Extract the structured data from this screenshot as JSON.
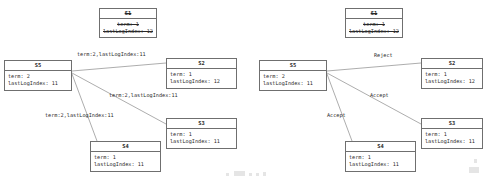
{
  "diagrams": [
    {
      "id": "left-diagram",
      "nodes": [
        {
          "id": "s1",
          "title": "S1",
          "stale": true,
          "lines": [
            "term: 1",
            "lastLogIndex: 12"
          ],
          "x": 99,
          "y": 8,
          "w": 58,
          "h": 30
        },
        {
          "id": "s5",
          "title": "S5",
          "stale": false,
          "lines": [
            "term: 2",
            "lastLogIndex: 11"
          ],
          "x": 4,
          "y": 60,
          "w": 68,
          "h": 31
        },
        {
          "id": "s2",
          "title": "S2",
          "stale": false,
          "lines": [
            "term: 1",
            "lastLogIndex: 12"
          ],
          "x": 166,
          "y": 58,
          "w": 71,
          "h": 31
        },
        {
          "id": "s3",
          "title": "S3",
          "stale": false,
          "lines": [
            "term: 1",
            "lastLogIndex: 11"
          ],
          "x": 166,
          "y": 118,
          "w": 71,
          "h": 31
        },
        {
          "id": "s4",
          "title": "S4",
          "stale": false,
          "lines": [
            "term: 1",
            "lastLogIndex: 11"
          ],
          "x": 90,
          "y": 141,
          "w": 71,
          "h": 31
        }
      ],
      "edges": [
        {
          "id": "s5-s2",
          "x1": 72,
          "y1": 71,
          "x2": 166,
          "y2": 63,
          "label": "term:2,lastLogIndex:11",
          "lx": 77,
          "ly": 51
        },
        {
          "id": "s5-s3",
          "x1": 72,
          "y1": 73,
          "x2": 166,
          "y2": 124,
          "label": "term:2,lastLogIndex:11",
          "lx": 109,
          "ly": 92
        },
        {
          "id": "s5-s4",
          "x1": 72,
          "y1": 74,
          "x2": 97,
          "y2": 141,
          "label": "term:2,lastLogIndex:11",
          "lx": 45,
          "ly": 112
        }
      ]
    },
    {
      "id": "right-diagram",
      "nodes": [
        {
          "id": "s1",
          "title": "S1",
          "stale": true,
          "lines": [
            "term: 1",
            "lastLogIndex: 12"
          ],
          "x": 345,
          "y": 8,
          "w": 58,
          "h": 30
        },
        {
          "id": "s5",
          "title": "S5",
          "stale": false,
          "lines": [
            "term: 2",
            "lastLogIndex: 11"
          ],
          "x": 259,
          "y": 60,
          "w": 68,
          "h": 31
        },
        {
          "id": "s2",
          "title": "S2",
          "stale": false,
          "lines": [
            "term: 1",
            "lastLogIndex: 12"
          ],
          "x": 421,
          "y": 58,
          "w": 62,
          "h": 31
        },
        {
          "id": "s3",
          "title": "S3",
          "stale": false,
          "lines": [
            "term: 1",
            "lastLogIndex: 11"
          ],
          "x": 421,
          "y": 118,
          "w": 62,
          "h": 31
        },
        {
          "id": "s4",
          "title": "S4",
          "stale": false,
          "lines": [
            "term: 1",
            "lastLogIndex: 11"
          ],
          "x": 345,
          "y": 141,
          "w": 71,
          "h": 31
        },
        {
          "id": "s4-partial",
          "title": "",
          "stale": false,
          "lines": [
            ""
          ],
          "x": 0,
          "y": 0,
          "w": 0,
          "h": 0
        }
      ],
      "edges": [
        {
          "id": "s5-s2",
          "x1": 327,
          "y1": 71,
          "x2": 421,
          "y2": 63,
          "label": "Reject",
          "lx": 374,
          "ly": 52
        },
        {
          "id": "s5-s3",
          "x1": 327,
          "y1": 73,
          "x2": 421,
          "y2": 124,
          "label": "Accept",
          "lx": 370,
          "ly": 92
        },
        {
          "id": "s5-s4",
          "x1": 327,
          "y1": 74,
          "x2": 352,
          "y2": 141,
          "label": "Accept",
          "lx": 327,
          "ly": 112
        }
      ]
    }
  ],
  "artifacts": {
    "caption_smudges": [
      {
        "x": 226,
        "y": 173,
        "w": 3,
        "h": 3
      },
      {
        "x": 234,
        "y": 171,
        "w": 11,
        "h": 5
      },
      {
        "x": 249,
        "y": 173,
        "w": 3,
        "h": 3
      },
      {
        "x": 256,
        "y": 173,
        "w": 3,
        "h": 3
      },
      {
        "x": 263,
        "y": 172,
        "w": 3,
        "h": 4
      },
      {
        "x": 469,
        "y": 167,
        "w": 10,
        "h": 6
      },
      {
        "x": 474,
        "y": 159,
        "w": 3,
        "h": 4
      }
    ]
  }
}
